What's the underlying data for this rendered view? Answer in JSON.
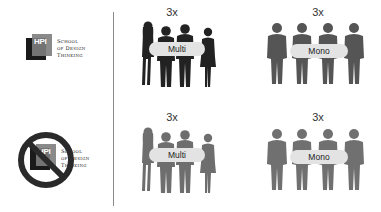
{
  "logo": {
    "badge": "HPI",
    "lines": [
      "School",
      "of Design",
      "Thinking"
    ]
  },
  "panels": [
    {
      "multiplier": "3x",
      "label": "Multi",
      "style": "dark"
    },
    {
      "multiplier": "3x",
      "label": "Mono",
      "style": "dark"
    },
    {
      "multiplier": "3x",
      "label": "Multi",
      "style": "light"
    },
    {
      "multiplier": "3x",
      "label": "Mono",
      "style": "light"
    }
  ],
  "colors": {
    "figure_dark": "#222222",
    "figure_mono": "#555555",
    "figure_light": "#6e6e6e",
    "figure_mono_light": "#707070",
    "pill": "#e3e3e3",
    "forbidden": "#2a2a2a"
  }
}
